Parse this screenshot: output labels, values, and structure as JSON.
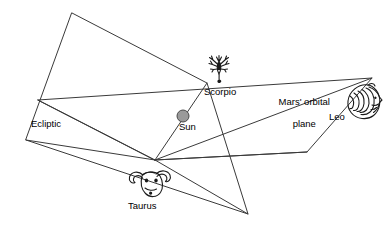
{
  "diagram": {
    "type": "astronomy-schematic",
    "canvas": {
      "width": 384,
      "height": 226,
      "background": "#ffffff"
    },
    "colors": {
      "line": "#3a3a3a",
      "ink": "#1a1a1a",
      "sun_fill": "#9a9a9a",
      "sun_stroke": "#4a4a4a",
      "text": "#000000",
      "background": "#ffffff"
    },
    "labels": {
      "ecliptic": "Ecliptic",
      "sun": "Sun",
      "scorpio": "Scorpio",
      "taurus": "Taurus",
      "leo": "Leo",
      "mars_plane_line1": "Mars' orbital",
      "mars_plane_line2": "plane"
    },
    "icons": {
      "sun": "sun-disc-icon",
      "scorpio": "scorpion-icon",
      "taurus": "bull-head-icon",
      "leo": "lion-head-icon"
    },
    "geometry": {
      "ecliptic_plane": {
        "name": "Ecliptic plane",
        "points": "72,13 207,83 248,214 26,140"
      },
      "mars_orbital_plane": {
        "name": "Mars' orbital plane",
        "points": "38,100 372,78 307,152 155,160"
      },
      "convergence_point": {
        "x": 155,
        "y": 160
      },
      "sun_position": {
        "x": 183,
        "y": 116,
        "radius": 6
      },
      "rays": [
        {
          "name": "ray-to-scorpio-through-sun",
          "x1": 155,
          "y1": 160,
          "x2": 207,
          "y2": 83
        },
        {
          "name": "ray-to-ecliptic-left",
          "x1": 155,
          "y1": 160,
          "x2": 26,
          "y2": 140
        },
        {
          "name": "ray-to-mars-left",
          "x1": 155,
          "y1": 160,
          "x2": 38,
          "y2": 100
        },
        {
          "name": "ray-to-ecliptic-bottom",
          "x1": 155,
          "y1": 160,
          "x2": 248,
          "y2": 214
        },
        {
          "name": "ray-to-mars-bottom",
          "x1": 155,
          "y1": 160,
          "x2": 307,
          "y2": 152
        },
        {
          "name": "ray-to-leo",
          "x1": 155,
          "y1": 160,
          "x2": 372,
          "y2": 78
        }
      ]
    }
  }
}
